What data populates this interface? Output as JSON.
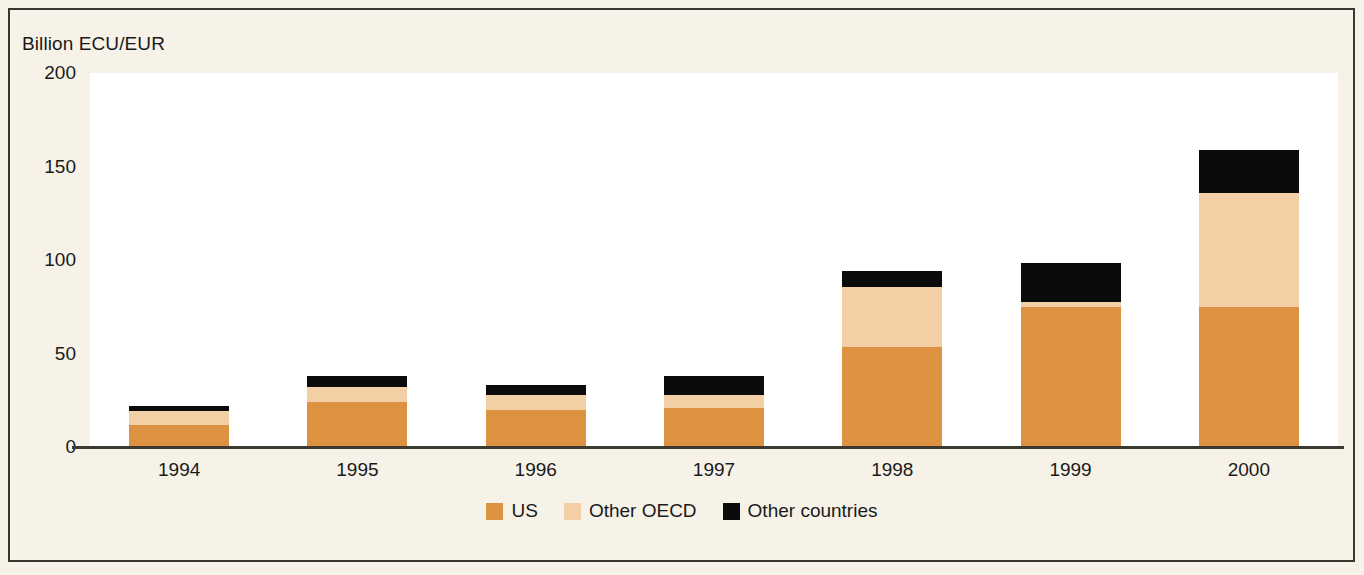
{
  "chart_data": {
    "type": "bar",
    "subtype": "stacked-vertical",
    "title": "",
    "ylabel": "Billion ECU/EUR",
    "xlabel": "",
    "categories": [
      "1994",
      "1995",
      "1996",
      "1997",
      "1998",
      "1999",
      "2000"
    ],
    "ylim": [
      0,
      200
    ],
    "yticks": [
      0,
      50,
      100,
      150,
      200
    ],
    "ytick_labels": [
      "0",
      "50",
      "100",
      "150",
      "200"
    ],
    "grid": false,
    "legend_position": "bottom-center",
    "series": [
      {
        "name": "US",
        "color": "#dd9242",
        "values": [
          12,
          24,
          20,
          21,
          53.5,
          75,
          75
        ]
      },
      {
        "name": "Other OECD",
        "color": "#f2cfa4",
        "values": [
          7,
          8,
          8,
          7,
          32,
          2.5,
          61
        ]
      },
      {
        "name": "Other countries",
        "color": "#0b0b0b",
        "values": [
          3,
          6,
          5,
          10,
          8.5,
          21,
          23
        ]
      }
    ],
    "totals": [
      22,
      38,
      33,
      38,
      94,
      98.5,
      159
    ]
  },
  "legend": {
    "items": [
      {
        "label": "US",
        "color": "#dd9242"
      },
      {
        "label": "Other OECD",
        "color": "#f2cfa4"
      },
      {
        "label": "Other countries",
        "color": "#0b0b0b"
      }
    ]
  },
  "colors": {
    "background": "#f6f2e8",
    "plot_background": "#ffffff",
    "frame": "#3a3632",
    "axis": "#3c3832",
    "text": "#1a1a1a"
  }
}
